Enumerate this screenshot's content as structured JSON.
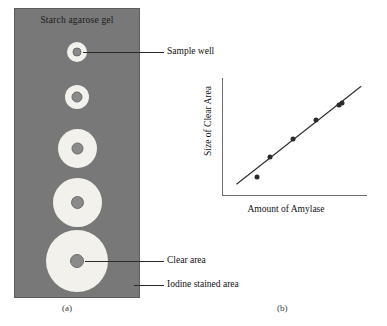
{
  "figure": {
    "panel_a": {
      "caption": "(a)",
      "gel_title": "Starch agarose gel",
      "gel_color": "#787878",
      "clear_zone_color": "#f2f1ec",
      "well_color": "#8a8a8a",
      "wells": [
        {
          "id": "well-1",
          "cy": 44,
          "clear_d": 20,
          "well_d": 9
        },
        {
          "id": "well-2",
          "cy": 89,
          "clear_d": 24,
          "well_d": 11
        },
        {
          "id": "well-3",
          "cy": 140,
          "clear_d": 39,
          "well_d": 12
        },
        {
          "id": "well-4",
          "cy": 194,
          "clear_d": 49,
          "well_d": 13
        },
        {
          "id": "well-5",
          "cy": 253,
          "clear_d": 62,
          "well_d": 14
        }
      ],
      "callouts": [
        {
          "id": "sample-well",
          "label": "Sample well"
        },
        {
          "id": "clear-area",
          "label": "Clear area"
        },
        {
          "id": "iodine-stained-area",
          "label": "Iodine stained area"
        }
      ]
    },
    "panel_b": {
      "caption": "(b)"
    }
  },
  "chart_data": {
    "type": "scatter",
    "title": "",
    "xlabel": "Amount of Amylase",
    "ylabel": "Size of Clear Area",
    "xlim": [
      0,
      10
    ],
    "ylim": [
      0,
      10
    ],
    "grid": false,
    "legend": "none",
    "axis_ticks": false,
    "points": [
      {
        "x": 2.4,
        "y": 1.6
      },
      {
        "x": 3.3,
        "y": 3.3
      },
      {
        "x": 4.9,
        "y": 4.8
      },
      {
        "x": 6.5,
        "y": 6.4
      },
      {
        "x": 8.1,
        "y": 7.7
      },
      {
        "x": 8.3,
        "y": 7.9
      }
    ],
    "series": [
      {
        "name": "Clear area vs amylase",
        "x": [
          2.4,
          3.3,
          4.9,
          6.5,
          8.1,
          8.3
        ],
        "values": [
          1.6,
          3.3,
          4.8,
          6.4,
          7.7,
          7.9
        ]
      }
    ],
    "trendline": {
      "x0": 1.0,
      "y0": 1.0,
      "x1": 9.6,
      "y1": 9.3,
      "style": "solid"
    }
  }
}
